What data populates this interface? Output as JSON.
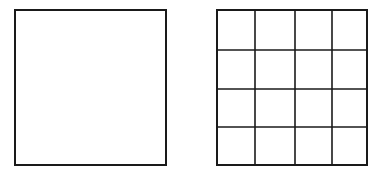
{
  "diagram": {
    "stroke_color": "#1a1a1a",
    "background": "#ffffff",
    "shapes": [
      {
        "id": "plain-square",
        "x": 15,
        "y": 10,
        "w": 151,
        "h": 155,
        "rows": 1,
        "cols": 1
      },
      {
        "id": "grid-square",
        "x": 217,
        "y": 10,
        "w": 150,
        "h": 155,
        "rows": 4,
        "cols": 4,
        "col_lines": [
          255,
          295,
          332
        ],
        "row_lines": [
          50,
          89,
          127
        ]
      }
    ]
  }
}
